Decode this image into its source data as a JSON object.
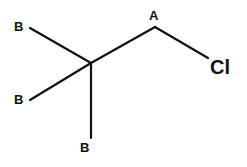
{
  "diagram": {
    "type": "skeletal-structure",
    "labels": {
      "a": "A",
      "cl": "Cl",
      "b1": "B",
      "b2": "B",
      "b3": "B"
    },
    "colors": {
      "bond": "#111111",
      "text": "#111111",
      "background": "#ffffff"
    }
  }
}
